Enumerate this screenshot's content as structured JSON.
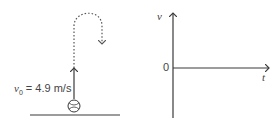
{
  "left_panel": {
    "velocity_symbol": "v",
    "velocity_subscript": "0",
    "velocity_value": "= 4.9 m/s",
    "description": "Ball thrown vertically upward from ground, dotted path rises then falls back"
  },
  "right_panel": {
    "y_axis_label": "v",
    "x_axis_label": "t",
    "origin_label": "0"
  },
  "colors": {
    "stroke": "#3a3a3a",
    "dotted": "#555555",
    "text": "#444444"
  }
}
